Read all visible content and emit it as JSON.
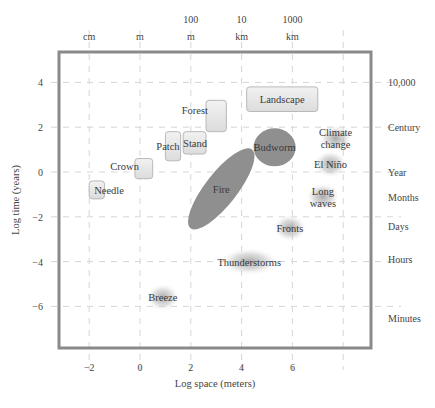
{
  "chart_data": {
    "type": "scatter",
    "title": "",
    "xlabel": "Log space (meters)",
    "ylabel": "Log time (years)",
    "xlim": [
      -3.2,
      9.1
    ],
    "ylim": [
      -7.6,
      5.5
    ],
    "grid": true,
    "x_ticks": [
      -2,
      0,
      2,
      4,
      6
    ],
    "y_ticks": [
      4,
      2,
      0,
      -2,
      -4,
      -6
    ],
    "top_axis": [
      {
        "x": -2,
        "line1": "",
        "line2": "cm"
      },
      {
        "x": 0,
        "line1": "",
        "line2": "m"
      },
      {
        "x": 2,
        "line1": "100",
        "line2": "m"
      },
      {
        "x": 4,
        "line1": "10",
        "line2": "km"
      },
      {
        "x": 6,
        "line1": "1000",
        "line2": "km"
      }
    ],
    "right_axis": [
      {
        "y": 4,
        "label": "10,000"
      },
      {
        "y": 2,
        "label": "Century"
      },
      {
        "y": 0,
        "label": "Year"
      },
      {
        "y": -1.1,
        "label": "Months"
      },
      {
        "y": -2.4,
        "label": "Days"
      },
      {
        "y": -3.9,
        "label": "Hours"
      },
      {
        "y": -6.5,
        "label": "Minutes"
      }
    ],
    "vegetation": [
      {
        "name": "Needle",
        "x": [
          -2.0,
          -1.4
        ],
        "y": [
          -1.2,
          -0.4
        ]
      },
      {
        "name": "Crown",
        "x": [
          -0.2,
          0.5
        ],
        "y": [
          -0.3,
          0.6
        ]
      },
      {
        "name": "Patch",
        "x": [
          1.0,
          1.6
        ],
        "y": [
          0.5,
          1.8
        ]
      },
      {
        "name": "Stand",
        "x": [
          1.7,
          2.6
        ],
        "y": [
          0.8,
          1.8
        ]
      },
      {
        "name": "Forest",
        "x": [
          2.6,
          3.4
        ],
        "y": [
          1.8,
          3.2
        ]
      },
      {
        "name": "Landscape",
        "x": [
          4.2,
          7.0
        ],
        "y": [
          2.7,
          3.8
        ]
      }
    ],
    "disturbance": [
      {
        "name": "Fire",
        "cx": 3.2,
        "cy": -0.75,
        "rx": 2.0,
        "ry": 0.75,
        "angle_deg": -52
      },
      {
        "name": "Budworm",
        "cx": 5.3,
        "cy": 1.1,
        "rx": 1.2,
        "ry": 0.85,
        "angle_deg": 0
      }
    ],
    "atmosphere": [
      {
        "name": "Climate change",
        "x": 7.7,
        "y": 1.5
      },
      {
        "name": "El Niño",
        "x": 7.5,
        "y": 0.35
      },
      {
        "name": "Long waves",
        "x": 7.2,
        "y": -1.1
      },
      {
        "name": "Fronts",
        "x": 5.9,
        "y": -2.5
      },
      {
        "name": "Thunderstorms",
        "x": 4.3,
        "y": -4.0
      },
      {
        "name": "Breeze",
        "x": 0.9,
        "y": -5.6
      }
    ]
  },
  "colors": {
    "frame": "#8a8a8a",
    "grid": "#d6d6d6",
    "box_fill": "#e8e8e8",
    "box_stroke": "#b8b8b8",
    "ellipse_fill": "#8f8f8f",
    "blob": "#9a9a9a"
  }
}
